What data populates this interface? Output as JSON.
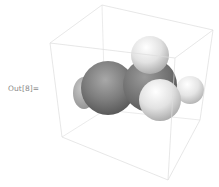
{
  "cell": {
    "output_label": "Out[8]=",
    "graphic": {
      "type": "3d-molecule-space-filling",
      "bounding_box": true,
      "atoms_visible": [
        {
          "color": "dark-gray",
          "role": "heavy-atom-left"
        },
        {
          "color": "dark-gray",
          "role": "heavy-atom-center"
        },
        {
          "color": "light-gray",
          "role": "hydrogen-top"
        },
        {
          "color": "light-gray",
          "role": "hydrogen-front"
        },
        {
          "color": "light-gray",
          "role": "hydrogen-right"
        }
      ],
      "colors": {
        "box_edge": "#dcdcdc",
        "dark_atom": "#7a7a7a",
        "light_atom": "#e6e6e6"
      }
    }
  }
}
